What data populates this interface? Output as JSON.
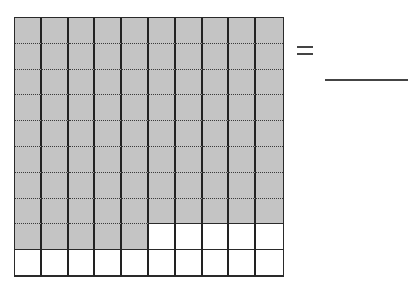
{
  "diagram": {
    "type": "hundred-grid",
    "rows": 10,
    "columns": 10,
    "total_squares": 100,
    "shaded_squares": 85,
    "unshaded_squares": 15,
    "shaded_pattern": "rows 1-8 fully shaded, row 9 first 5 columns shaded, remaining unshaded",
    "colors": {
      "shaded": "#c4c4c4",
      "unshaded": "#ffffff",
      "gridline": "#2a2a2a"
    }
  },
  "equation": {
    "operator": "=",
    "answer": ""
  }
}
